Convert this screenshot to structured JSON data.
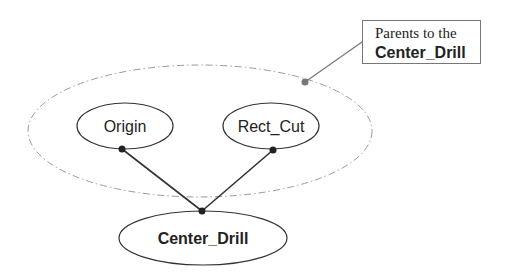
{
  "diagram": {
    "type": "parent-child dependency graph",
    "group": {
      "label_line1": "Parents to the",
      "label_line2": "Center_Drill",
      "style": "dash-dot ellipse",
      "color": "#999999"
    },
    "nodes": [
      {
        "id": "origin",
        "label": "Origin"
      },
      {
        "id": "rect_cut",
        "label": "Rect_Cut"
      },
      {
        "id": "center_drill",
        "label": "Center_Drill"
      }
    ],
    "edges": [
      {
        "from": "origin",
        "to": "center_drill"
      },
      {
        "from": "rect_cut",
        "to": "center_drill"
      }
    ],
    "colors": {
      "stroke": "#333333",
      "group_stroke": "#999999",
      "callout_border": "#777777"
    }
  }
}
